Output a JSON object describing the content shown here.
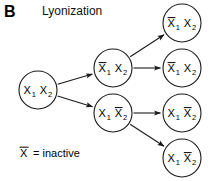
{
  "panel": {
    "label": "B",
    "title": "Lyonization"
  },
  "legend": {
    "symbol": "X",
    "overbar": true,
    "text": "= inactive",
    "full": "X̄ = inactive"
  },
  "diagram": {
    "type": "tree",
    "orientation": "left-to-right",
    "nodes": [
      {
        "id": "root",
        "column": 0,
        "cx": 38,
        "cy": 90,
        "r": 19,
        "alleles": [
          {
            "symbol": "X",
            "subscript": "1",
            "inactive": false
          },
          {
            "symbol": "X",
            "subscript": "2",
            "inactive": false
          }
        ],
        "text": "X1 X2"
      },
      {
        "id": "mid-upper",
        "column": 1,
        "cx": 113,
        "cy": 68,
        "r": 19,
        "alleles": [
          {
            "symbol": "X",
            "subscript": "1",
            "inactive": true
          },
          {
            "symbol": "X",
            "subscript": "2",
            "inactive": false
          }
        ],
        "text": "X̄1 X2"
      },
      {
        "id": "mid-lower",
        "column": 1,
        "cx": 113,
        "cy": 113,
        "r": 19,
        "alleles": [
          {
            "symbol": "X",
            "subscript": "1",
            "inactive": false
          },
          {
            "symbol": "X",
            "subscript": "2",
            "inactive": true
          }
        ],
        "text": "X1 X̄2"
      },
      {
        "id": "leaf-1",
        "column": 2,
        "cx": 182,
        "cy": 23,
        "r": 19,
        "alleles": [
          {
            "symbol": "X",
            "subscript": "1",
            "inactive": true
          },
          {
            "symbol": "X",
            "subscript": "2",
            "inactive": false
          }
        ],
        "text": "X̄1 X2"
      },
      {
        "id": "leaf-2",
        "column": 2,
        "cx": 182,
        "cy": 68,
        "r": 19,
        "alleles": [
          {
            "symbol": "X",
            "subscript": "1",
            "inactive": true
          },
          {
            "symbol": "X",
            "subscript": "2",
            "inactive": false
          }
        ],
        "text": "X̄1 X2"
      },
      {
        "id": "leaf-3",
        "column": 2,
        "cx": 182,
        "cy": 113,
        "r": 19,
        "alleles": [
          {
            "symbol": "X",
            "subscript": "1",
            "inactive": false
          },
          {
            "symbol": "X",
            "subscript": "2",
            "inactive": true
          }
        ],
        "text": "X1 X̄2"
      },
      {
        "id": "leaf-4",
        "column": 2,
        "cx": 182,
        "cy": 158,
        "r": 19,
        "alleles": [
          {
            "symbol": "X",
            "subscript": "1",
            "inactive": false
          },
          {
            "symbol": "X",
            "subscript": "2",
            "inactive": true
          }
        ],
        "text": "X1 X̄2"
      }
    ],
    "edges": [
      {
        "id": "edge-root-to-mid-upper",
        "from": "root",
        "to": "mid-upper"
      },
      {
        "id": "edge-root-to-mid-lower",
        "from": "root",
        "to": "mid-lower"
      },
      {
        "id": "edge-mid-upper-to-leaf-1",
        "from": "mid-upper",
        "to": "leaf-1"
      },
      {
        "id": "edge-mid-upper-to-leaf-2",
        "from": "mid-upper",
        "to": "leaf-2"
      },
      {
        "id": "edge-mid-lower-to-leaf-3",
        "from": "mid-lower",
        "to": "leaf-3"
      },
      {
        "id": "edge-mid-lower-to-leaf-4",
        "from": "mid-lower",
        "to": "leaf-4"
      }
    ]
  },
  "colors": {
    "background": "#ffffff",
    "stroke": "#1a1a1a",
    "text": "#000000"
  }
}
